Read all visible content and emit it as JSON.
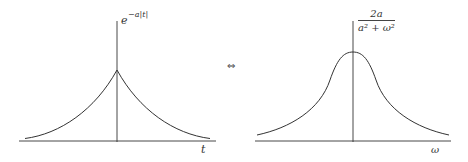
{
  "left_plot": {
    "function_label": "e",
    "function_exponent": "−a|t|",
    "x_axis_label": "t",
    "shape": "two-sided exponential decay (cusp at origin)"
  },
  "equivalence_symbol": "⇔",
  "right_plot": {
    "numerator": "2a",
    "denominator": "a² + ω²",
    "x_axis_label": "ω",
    "shape": "Lorentzian (smooth peak at origin)"
  },
  "colors": {
    "curve": "#333333",
    "axis": "#333333",
    "background": "#ffffff"
  }
}
